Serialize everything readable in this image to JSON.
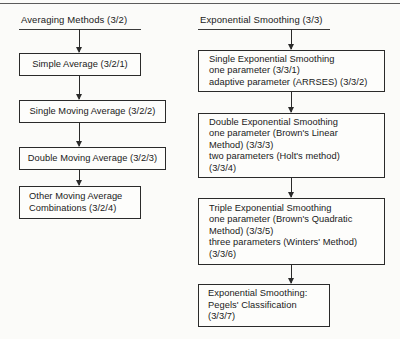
{
  "figure": {
    "columns": [
      {
        "id": "averaging",
        "header": "Averaging Methods (3/2)",
        "nodes": [
          {
            "id": "simple-average",
            "text": "Simple Average (3/2/1)"
          },
          {
            "id": "single-moving-average",
            "text": "Single Moving Average (3/2/2)"
          },
          {
            "id": "double-moving-average",
            "text": "Double Moving Average (3/2/3)"
          },
          {
            "id": "other-moving-average",
            "text": "Other Moving Average\nCombinations (3/2/4)"
          }
        ]
      },
      {
        "id": "exponential-smoothing",
        "header": "Exponential Smoothing (3/3)",
        "nodes": [
          {
            "id": "single-exponential-smoothing",
            "text": "Single Exponential Smoothing\n   one parameter (3/3/1)\n   adaptive parameter (ARRSES) (3/3/2)"
          },
          {
            "id": "double-exponential-smoothing",
            "text": "Double Exponential Smoothing\n   one parameter (Brown's Linear\n      Method) (3/3/3)\n   two parameters (Holt's method)\n      (3/3/4)"
          },
          {
            "id": "triple-exponential-smoothing",
            "text": "Triple Exponential Smoothing\n   one parameter (Brown's Quadratic\n      Method) (3/3/5)\n   three parameters (Winters' Method)\n      (3/3/6)"
          },
          {
            "id": "pegels-classification",
            "text": "Exponential Smoothing:\nPegels' Classification\n(3/3/7)"
          }
        ]
      }
    ]
  }
}
